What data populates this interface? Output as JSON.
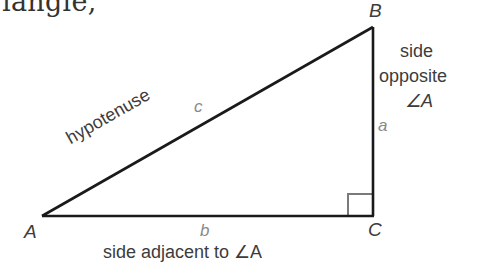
{
  "caption_fragment": "iangle,",
  "diagram": {
    "type": "right-triangle",
    "vertices": {
      "A": {
        "label": "A",
        "x": 42,
        "y": 216
      },
      "B": {
        "label": "B",
        "x": 373,
        "y": 27
      },
      "C": {
        "label": "C",
        "x": 373,
        "y": 216
      }
    },
    "sides": {
      "hypotenuse": {
        "text": "hypotenuse",
        "letter": "c"
      },
      "opposite": {
        "line1": "side",
        "line2": "opposite",
        "line3": "∠A",
        "letter": "a"
      },
      "adjacent": {
        "text": "side adjacent to ∠A",
        "letter": "b"
      }
    },
    "right_angle_marker": "right-angle-at-C",
    "colors": {
      "line": "#1a1a1a",
      "text": "#3c3c3c",
      "letter": "#8a8a8a",
      "marker": "#7a7a7a"
    }
  }
}
